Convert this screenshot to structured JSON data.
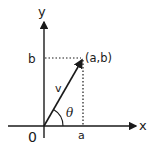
{
  "diagram": {
    "type": "vector-in-plane",
    "axes": {
      "x_label": "x",
      "y_label": "y",
      "origin_label": "0"
    },
    "point": {
      "label": "(a,b)"
    },
    "projections": {
      "x_label": "a",
      "y_label": "b"
    },
    "vector": {
      "label": "v"
    },
    "angle": {
      "label": "θ"
    }
  }
}
